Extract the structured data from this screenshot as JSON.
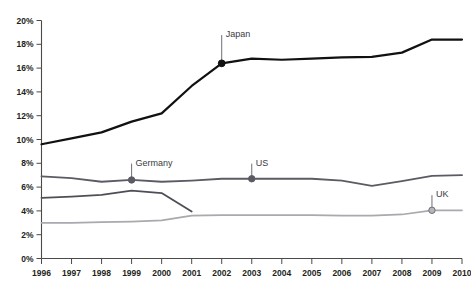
{
  "chart_data": {
    "type": "line",
    "title": "",
    "xlabel": "",
    "ylabel": "",
    "xlim": [
      1996,
      2010
    ],
    "ylim": [
      0,
      20
    ],
    "ytick_suffix": "%",
    "grid": false,
    "legend": "annotations-on-lines",
    "x": [
      1996,
      1997,
      1998,
      1999,
      2000,
      2001,
      2002,
      2003,
      2004,
      2005,
      2006,
      2007,
      2008,
      2009,
      2010
    ],
    "categories": [
      "1996",
      "1997",
      "1998",
      "1999",
      "2000",
      "2001",
      "2002",
      "2003",
      "2004",
      "2005",
      "2006",
      "2007",
      "2008",
      "2009",
      "2010"
    ],
    "yticks": [
      0,
      2,
      4,
      6,
      8,
      10,
      12,
      14,
      16,
      18,
      20
    ],
    "ytick_labels": [
      "0%",
      "2%",
      "4%",
      "6%",
      "8%",
      "10%",
      "12%",
      "14%",
      "16%",
      "18%",
      "20%"
    ],
    "series": [
      {
        "name": "Japan",
        "color": "#111111",
        "width": 2.2,
        "values": [
          9.6,
          10.1,
          10.6,
          11.5,
          12.2,
          14.5,
          16.4,
          16.8,
          16.7,
          16.8,
          16.9,
          16.95,
          17.3,
          18.4,
          18.4
        ],
        "marker": {
          "x": 2002,
          "y": 16.4,
          "style": "filled",
          "fill": "#111111",
          "stroke": "#111111",
          "r": 3.4
        },
        "label": {
          "text": "Japan",
          "x": 2002,
          "y": 18.9,
          "anchor": "start",
          "leader": true
        }
      },
      {
        "name": "US",
        "color": "#5b5b63",
        "width": 1.8,
        "values": [
          6.9,
          6.75,
          6.45,
          6.6,
          6.45,
          6.55,
          6.7,
          6.7,
          6.7,
          6.7,
          6.55,
          6.1,
          6.5,
          6.95,
          7.0
        ],
        "marker": {
          "x": 2003,
          "y": 6.7,
          "style": "filled",
          "fill": "#5b5b63",
          "stroke": "#5b5b63",
          "r": 3.2
        },
        "label": {
          "text": "US",
          "x": 2003,
          "y": 8.1,
          "anchor": "start",
          "leader": true
        }
      },
      {
        "name": "Germany",
        "color": "#4e4e56",
        "width": 1.8,
        "values": [
          5.1,
          5.2,
          5.35,
          5.7,
          5.5,
          3.95,
          null,
          null,
          null,
          null,
          null,
          null,
          null,
          null,
          null
        ],
        "marker": {
          "x": 1999,
          "y": 6.6,
          "style": "filled",
          "fill": "#5b5b63",
          "stroke": "#5b5b63",
          "r": 3.2
        },
        "label": {
          "text": "Germany",
          "x": 1999,
          "y": 8.1,
          "anchor": "start",
          "leader": true
        }
      },
      {
        "name": "UK",
        "color": "#a9a9ae",
        "width": 1.7,
        "values": [
          3.0,
          3.0,
          3.05,
          3.1,
          3.2,
          3.6,
          3.65,
          3.65,
          3.65,
          3.65,
          3.6,
          3.6,
          3.7,
          4.05,
          4.05
        ],
        "marker": {
          "x": 2009,
          "y": 4.05,
          "style": "open",
          "fill": "#b5b5ba",
          "stroke": "#6f6f78",
          "r": 3.2
        },
        "label": {
          "text": "UK",
          "x": 2009,
          "y": 5.45,
          "anchor": "start",
          "leader": true
        }
      }
    ],
    "annotations": [
      {
        "text": "Japan",
        "series": "Japan"
      },
      {
        "text": "Germany",
        "series": "Germany"
      },
      {
        "text": "US",
        "series": "US"
      },
      {
        "text": "UK",
        "series": "UK"
      }
    ]
  },
  "colors": {
    "japan": "#111111",
    "us": "#5b5b63",
    "germany": "#4e4e56",
    "uk": "#a9a9ae",
    "axis": "#4a4a4a",
    "text": "#231f20",
    "background": "#ffffff"
  }
}
